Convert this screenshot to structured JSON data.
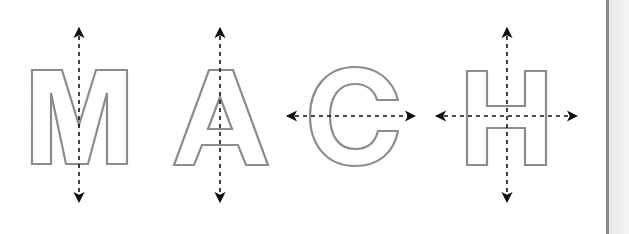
{
  "figure": {
    "title": "MACH letter symmetry lines",
    "letters": [
      {
        "char": "M",
        "symmetry": [
          "vertical"
        ]
      },
      {
        "char": "A",
        "symmetry": [
          "vertical"
        ]
      },
      {
        "char": "C",
        "symmetry": [
          "horizontal"
        ]
      },
      {
        "char": "H",
        "symmetry": [
          "vertical",
          "horizontal"
        ]
      }
    ],
    "colors": {
      "letter_outline": "#8c8c8c",
      "axis_line": "#111111",
      "background": "#ffffff",
      "divider": "#8a8a8a"
    }
  }
}
